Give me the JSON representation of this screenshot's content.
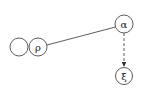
{
  "diagram": {
    "nodes": [
      {
        "id": "empty",
        "label": "",
        "cx": 19,
        "cy": 47,
        "r": 9
      },
      {
        "id": "rho",
        "label": "ρ",
        "cx": 38,
        "cy": 47,
        "r": 9
      },
      {
        "id": "alpha",
        "label": "α",
        "cx": 124,
        "cy": 24,
        "r": 9
      },
      {
        "id": "xi",
        "label": "ξ",
        "cx": 124,
        "cy": 76,
        "r": 8.5
      }
    ],
    "edges": [
      {
        "from": "rho",
        "to": "alpha",
        "style": "solid",
        "arrow": false
      },
      {
        "from": "alpha",
        "to": "xi",
        "style": "dashed",
        "arrow": true
      }
    ],
    "colors": {
      "stroke": "#333333",
      "background": "#ffffff"
    }
  }
}
